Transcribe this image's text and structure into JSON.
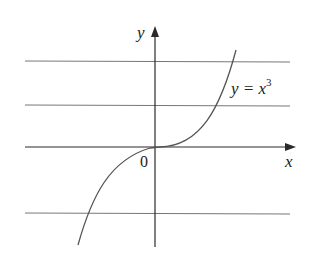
{
  "figure": {
    "axes": {
      "x_label": "x",
      "y_label": "y",
      "origin_label": "0"
    },
    "curve": {
      "label_lhs": "y = x",
      "label_exp": "3",
      "function": "y = x^3"
    },
    "horizontal_lines_count": 4,
    "colors": {
      "axis": "#2a2a2a",
      "curve": "#555555",
      "hline": "#666666",
      "text": "#222222"
    }
  }
}
